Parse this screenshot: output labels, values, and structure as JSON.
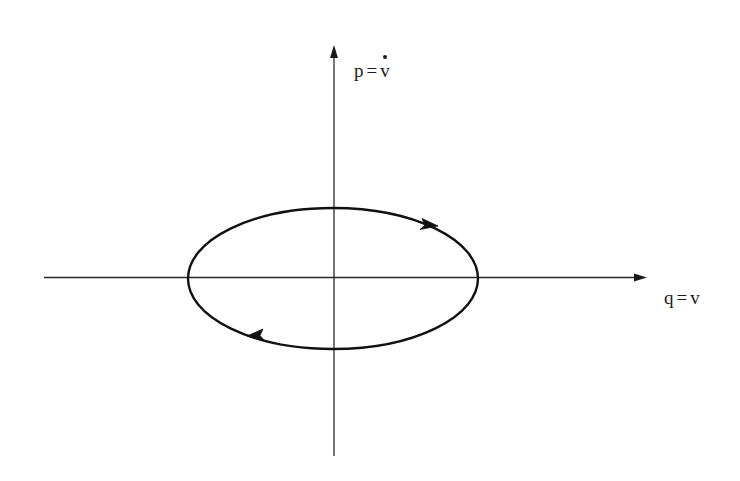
{
  "diagram": {
    "axes": {
      "vertical": {
        "label_lhs": "p",
        "label_eq": "=",
        "label_rhs": "v",
        "label_rhs_accent": "dot",
        "label_text": "p = v̇"
      },
      "horizontal": {
        "label_lhs": "q",
        "label_eq": "=",
        "label_rhs": "v",
        "label_text": "q = v"
      }
    },
    "orbit": {
      "shape": "ellipse",
      "direction": "clockwise",
      "arrow_count": 2
    },
    "colors": {
      "stroke": "#1a1a1a",
      "background": "#ffffff"
    }
  }
}
